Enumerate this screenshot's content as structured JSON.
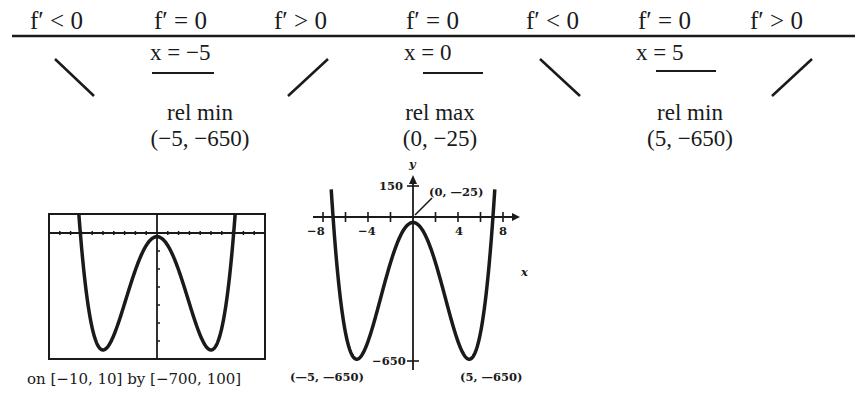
{
  "sign_chart": {
    "intervals": [
      {
        "label": "f′ < 0",
        "trend": "decreasing"
      },
      {
        "label": "f′ = 0",
        "critical_x": "x = −5"
      },
      {
        "label": "f′ > 0",
        "trend": "increasing"
      },
      {
        "label": "f′ = 0",
        "critical_x": "x = 0"
      },
      {
        "label": "f′ < 0",
        "trend": "decreasing"
      },
      {
        "label": "f′ = 0",
        "critical_x": "x = 5"
      },
      {
        "label": "f′ > 0",
        "trend": "increasing"
      }
    ],
    "extrema": [
      {
        "type": "rel min",
        "point": "(−5, −650)"
      },
      {
        "type": "rel max",
        "point": "(0, −25)"
      },
      {
        "type": "rel min",
        "point": "(5, −650)"
      }
    ]
  },
  "calculator_graph": {
    "caption": "on [−10, 10] by [−700, 100]"
  },
  "sketch_graph": {
    "y_axis_label": "y",
    "x_axis_label": "x",
    "y_ticks": [
      "150",
      "−650"
    ],
    "x_ticks": [
      "−8",
      "−4",
      "4",
      "8"
    ],
    "annotations": [
      "(0, —25)",
      "(—5, —650)",
      "(5, —650)"
    ]
  },
  "chart_data": [
    {
      "type": "line",
      "title": "Calculator graph of f(x)",
      "function": "x^4 - 50x^2 - 25",
      "xlim": [
        -10,
        10
      ],
      "ylim": [
        -700,
        100
      ],
      "caption": "on [−10, 10] by [−700, 100]",
      "key_points": [
        {
          "x": -5,
          "y": -650
        },
        {
          "x": 0,
          "y": -25
        },
        {
          "x": 5,
          "y": -650
        }
      ]
    },
    {
      "type": "line",
      "title": "Sketch of f(x)",
      "function": "x^4 - 50x^2 - 25",
      "xlabel": "x",
      "ylabel": "y",
      "x_ticks": [
        -8,
        -4,
        4,
        8
      ],
      "y_ticks": [
        150,
        -650
      ],
      "annotations": [
        {
          "text": "(0, —25)",
          "x": 0,
          "y": -25
        },
        {
          "text": "(—5, —650)",
          "x": -5,
          "y": -650
        },
        {
          "text": "(5, —650)",
          "x": 5,
          "y": -650
        }
      ]
    }
  ]
}
